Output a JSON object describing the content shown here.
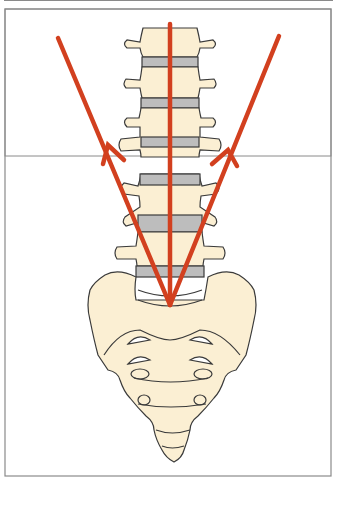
{
  "figure": {
    "colors": {
      "bone_fill": "#fbefd3",
      "disc_fill": "#bdbdbd",
      "outline": "#3a3a3a",
      "arrow": "#d2401f",
      "frame_border": "#8a8a8a",
      "background": "#ffffff"
    },
    "arrows": [
      {
        "name": "left-arrow",
        "from": [
          170,
          305
        ],
        "to": [
          58,
          38
        ],
        "direction": "up-left"
      },
      {
        "name": "center-arrow",
        "from": [
          170,
          305
        ],
        "to": [
          170,
          24
        ],
        "direction": "up"
      },
      {
        "name": "right-arrow",
        "from": [
          170,
          305
        ],
        "to": [
          279,
          36
        ],
        "direction": "up-right"
      }
    ],
    "vertebrae_count": 5,
    "labels": []
  }
}
